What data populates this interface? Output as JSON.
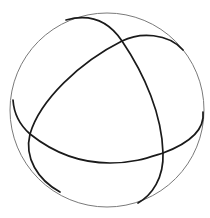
{
  "figure": {
    "title": "Sphere with three great circles",
    "sphere": {
      "cx": 107,
      "cy": 110,
      "r": 97,
      "stroke": "#7a7a7a"
    },
    "great_circles": [
      {
        "name": "great-circle-a",
        "path": "M 66 20 C 95 12, 112 26, 122 41 C 145 75, 162 115, 163 153 C 164 178, 152 195, 138 203",
        "stroke": "#1a1a1a"
      },
      {
        "name": "great-circle-b",
        "path": "M 183 50 C 168 33, 140 32, 122 41 C 80 62, 40 100, 30 134 C 24 158, 38 180, 60 192",
        "stroke": "#1a1a1a"
      },
      {
        "name": "great-circle-c",
        "path": "M 13 100 C 14 115, 22 127, 30 134 C 60 158, 90 163, 110 163 C 135 163, 150 157, 163 153 C 190 143, 205 130, 203 112",
        "stroke": "#1a1a1a"
      }
    ]
  }
}
